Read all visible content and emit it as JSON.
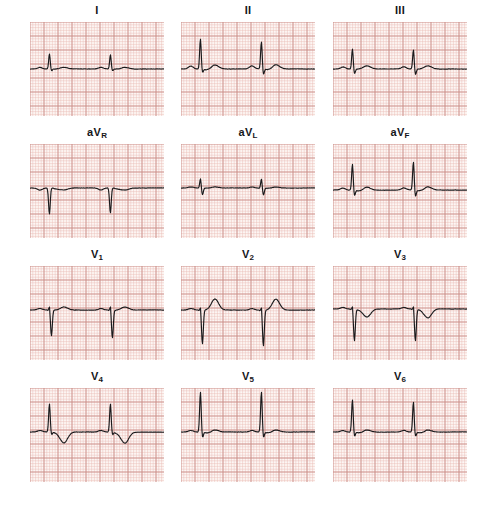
{
  "document": {
    "type": "12-lead-electrocardiogram",
    "paper_color": "#fdf7f5",
    "grid_minor_color": "#e9b9b4",
    "grid_major_color": "#c98b86",
    "trace_color": "#1a1a1c",
    "label_color": "#15161a"
  },
  "grid": {
    "minor_px": 2.8,
    "major_every": 5,
    "panel_width_px": 134,
    "panel_height_px": 94,
    "paper_speed": "25 mm/s",
    "gain": "10 mm/mV"
  },
  "layout": {
    "rows": 4,
    "columns": 3,
    "row_tops": [
      0,
      122,
      244,
      366
    ],
    "column_lefts": [
      30,
      181,
      333
    ]
  },
  "leads": [
    {
      "id": "I",
      "label": "I",
      "label_base": "I",
      "label_sub": "",
      "row": 0,
      "col": 0,
      "baseline_y": 47,
      "description": "small R waves, low amplitude, flat baseline",
      "beats": [
        {
          "p_amp": 1.5,
          "r_amp": 15,
          "s_amp": 2,
          "t_amp": 1.5
        },
        {
          "p_amp": 1.5,
          "r_amp": 14,
          "s_amp": 2,
          "t_amp": 1.5
        }
      ]
    },
    {
      "id": "II",
      "label": "II",
      "label_base": "II",
      "label_sub": "",
      "row": 0,
      "col": 1,
      "baseline_y": 47,
      "description": "tall R waves with visible P waves and broad T waves",
      "beats": [
        {
          "p_amp": 3,
          "r_amp": 30,
          "s_amp": 4,
          "t_amp": 4
        },
        {
          "p_amp": 3,
          "r_amp": 27,
          "s_amp": 6,
          "t_amp": 4
        }
      ]
    },
    {
      "id": "III",
      "label": "III",
      "label_base": "III",
      "label_sub": "",
      "row": 0,
      "col": 2,
      "baseline_y": 47,
      "description": "moderate R waves with small S waves and low T waves",
      "beats": [
        {
          "p_amp": 2,
          "r_amp": 20,
          "s_amp": 5,
          "t_amp": 3
        },
        {
          "p_amp": 2,
          "r_amp": 19,
          "s_amp": 6,
          "t_amp": 3
        }
      ]
    },
    {
      "id": "aVR",
      "label": "aVR",
      "label_base": "aV",
      "label_sub": "R",
      "row": 1,
      "col": 0,
      "baseline_y": 44,
      "description": "deep negative QS complexes, inverted P and T waves",
      "beats": [
        {
          "p_amp": -2,
          "r_amp": -26,
          "s_amp": 0,
          "t_amp": -2
        },
        {
          "p_amp": -2,
          "r_amp": -25,
          "s_amp": 0,
          "t_amp": -2
        }
      ]
    },
    {
      "id": "aVL",
      "label": "aVL",
      "label_base": "aV",
      "label_sub": "L",
      "row": 1,
      "col": 1,
      "baseline_y": 44,
      "description": "small biphasic rS complexes, very low amplitude",
      "beats": [
        {
          "p_amp": 1,
          "r_amp": 9,
          "s_amp": 7,
          "t_amp": 1
        },
        {
          "p_amp": 1,
          "r_amp": 9,
          "s_amp": 7,
          "t_amp": 1
        }
      ]
    },
    {
      "id": "aVF",
      "label": "aVF",
      "label_base": "aV",
      "label_sub": "F",
      "row": 1,
      "col": 2,
      "baseline_y": 46,
      "description": "tall R waves with S waves and depressed ST segment",
      "beats": [
        {
          "p_amp": 2,
          "r_amp": 26,
          "s_amp": 6,
          "t_amp": 3
        },
        {
          "p_amp": 2,
          "r_amp": 28,
          "s_amp": 7,
          "t_amp": 3
        }
      ]
    },
    {
      "id": "V1",
      "label": "V1",
      "label_base": "V",
      "label_sub": "1",
      "row": 2,
      "col": 0,
      "baseline_y": 44,
      "description": "rS pattern with deep S waves and small upright T",
      "beats": [
        {
          "p_amp": 1.5,
          "r_amp": 3,
          "s_amp": 26,
          "t_amp": 3
        },
        {
          "p_amp": 1.5,
          "r_amp": 3,
          "s_amp": 28,
          "t_amp": 3
        }
      ]
    },
    {
      "id": "V2",
      "label": "V2",
      "label_base": "V",
      "label_sub": "2",
      "row": 2,
      "col": 1,
      "baseline_y": 44,
      "description": "deep S waves with prominent elevated ST and T waves",
      "beats": [
        {
          "p_amp": 1.5,
          "r_amp": 2,
          "s_amp": 34,
          "t_amp": 11
        },
        {
          "p_amp": 1.5,
          "r_amp": 2,
          "s_amp": 36,
          "t_amp": 11
        }
      ]
    },
    {
      "id": "V3",
      "label": "V3",
      "label_base": "V",
      "label_sub": "3",
      "row": 2,
      "col": 2,
      "baseline_y": 43,
      "description": "deep S waves followed by inverted T waves",
      "beats": [
        {
          "p_amp": 1.5,
          "r_amp": 2,
          "s_amp": 32,
          "t_amp": -8
        },
        {
          "p_amp": 1.5,
          "r_amp": 2,
          "s_amp": 32,
          "t_amp": -9
        }
      ]
    },
    {
      "id": "V4",
      "label": "V4",
      "label_base": "V",
      "label_sub": "4",
      "row": 3,
      "col": 0,
      "baseline_y": 44,
      "description": "tall R waves followed by deep inverted T waves",
      "beats": [
        {
          "p_amp": 1.5,
          "r_amp": 28,
          "s_amp": 3,
          "t_amp": -11
        },
        {
          "p_amp": 1.5,
          "r_amp": 28,
          "s_amp": 3,
          "t_amp": -11
        }
      ]
    },
    {
      "id": "V5",
      "label": "V5",
      "label_base": "V",
      "label_sub": "5",
      "row": 3,
      "col": 1,
      "baseline_y": 44,
      "description": "very tall R waves with depressed ST segment",
      "beats": [
        {
          "p_amp": 1.5,
          "r_amp": 40,
          "s_amp": 6,
          "t_amp": 2
        },
        {
          "p_amp": 1.5,
          "r_amp": 40,
          "s_amp": 6,
          "t_amp": 2
        }
      ]
    },
    {
      "id": "V6",
      "label": "V6",
      "label_base": "V",
      "label_sub": "6",
      "row": 3,
      "col": 2,
      "baseline_y": 44,
      "description": "tall R waves with small S and low flat T waves",
      "beats": [
        {
          "p_amp": 1.5,
          "r_amp": 32,
          "s_amp": 5,
          "t_amp": 2
        },
        {
          "p_amp": 1.5,
          "r_amp": 30,
          "s_amp": 5,
          "t_amp": 2
        }
      ]
    }
  ],
  "chart_data": {
    "type": "line",
    "xlabel": "Time",
    "ylabel": "Amplitude (mV)",
    "grid": true,
    "legend_position": "above-each-panel",
    "x_scale": "25 mm/s",
    "y_scale": "10 mm/mV",
    "series": [
      {
        "name": "I",
        "r_wave_mm": 5,
        "s_wave_mm": 0.7,
        "t_wave_mm": 0.5,
        "beats": 2
      },
      {
        "name": "II",
        "r_wave_mm": 10,
        "s_wave_mm": 1.4,
        "t_wave_mm": 1.4,
        "beats": 2
      },
      {
        "name": "III",
        "r_wave_mm": 6.7,
        "s_wave_mm": 1.7,
        "t_wave_mm": 1.0,
        "beats": 2
      },
      {
        "name": "aVR",
        "r_wave_mm": -8.7,
        "s_wave_mm": 0,
        "t_wave_mm": -0.7,
        "beats": 2
      },
      {
        "name": "aVL",
        "r_wave_mm": 3,
        "s_wave_mm": 2.3,
        "t_wave_mm": 0.3,
        "beats": 2
      },
      {
        "name": "aVF",
        "r_wave_mm": 9,
        "s_wave_mm": 2.2,
        "t_wave_mm": 1.0,
        "beats": 2
      },
      {
        "name": "V1",
        "r_wave_mm": 1,
        "s_wave_mm": 9,
        "t_wave_mm": 1.0,
        "beats": 2
      },
      {
        "name": "V2",
        "r_wave_mm": 0.7,
        "s_wave_mm": 11.7,
        "t_wave_mm": 3.7,
        "beats": 2
      },
      {
        "name": "V3",
        "r_wave_mm": 0.7,
        "s_wave_mm": 10.7,
        "t_wave_mm": -2.8,
        "beats": 2
      },
      {
        "name": "V4",
        "r_wave_mm": 9.3,
        "s_wave_mm": 1.0,
        "t_wave_mm": -3.7,
        "beats": 2
      },
      {
        "name": "V5",
        "r_wave_mm": 13.3,
        "s_wave_mm": 2.0,
        "t_wave_mm": 0.7,
        "beats": 2
      },
      {
        "name": "V6",
        "r_wave_mm": 10.7,
        "s_wave_mm": 1.7,
        "t_wave_mm": 0.7,
        "beats": 2
      }
    ]
  }
}
